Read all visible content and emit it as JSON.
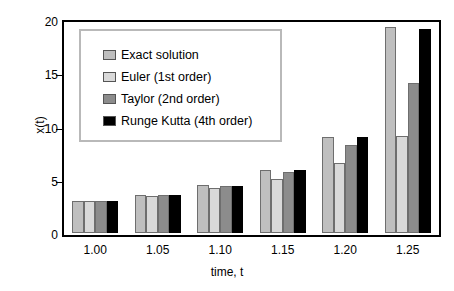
{
  "chart_data": {
    "type": "bar",
    "title": "",
    "xlabel": "time, t",
    "ylabel": "x(t)",
    "categories": [
      "1.00",
      "1.05",
      "1.10",
      "1.15",
      "1.20",
      "1.25"
    ],
    "series": [
      {
        "name": "Exact solution",
        "color": "#bfbfbf",
        "values": [
          3.0,
          3.6,
          4.5,
          5.95,
          9.0,
          19.3
        ]
      },
      {
        "name": "Euler (1st order)",
        "color": "#d9d9d9",
        "values": [
          3.0,
          3.5,
          4.2,
          5.1,
          6.6,
          9.1
        ]
      },
      {
        "name": "Taylor (2nd order)",
        "color": "#8c8c8c",
        "values": [
          3.0,
          3.55,
          4.45,
          5.75,
          8.3,
          14.1
        ]
      },
      {
        "name": "Runge Kutta (4th order)",
        "color": "#000000",
        "values": [
          3.0,
          3.55,
          4.45,
          5.95,
          9.0,
          19.2
        ]
      }
    ],
    "ylim": [
      0,
      20
    ],
    "yticks": [
      "0",
      "5",
      "10",
      "15",
      "20"
    ],
    "ytick_values": [
      0,
      5,
      10,
      15,
      20
    ],
    "grid": false,
    "legend_position": "upper-left",
    "frame_color": "#000000",
    "background": "#ffffff"
  }
}
